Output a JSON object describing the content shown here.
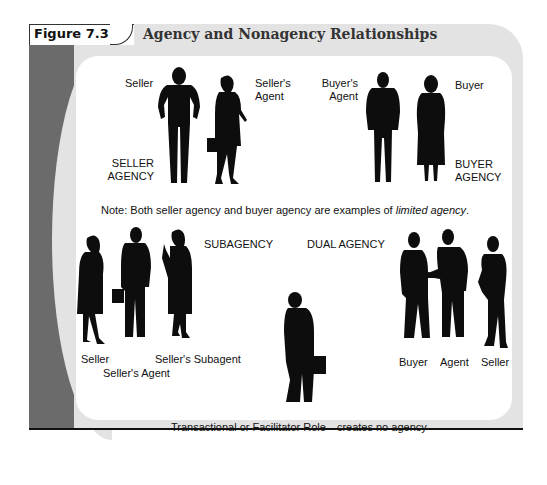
{
  "figure": {
    "number": "Figure 7.3",
    "title": "Agency and Nonagency Relationships"
  },
  "seller_agency": {
    "group_label_line1": "SELLER",
    "group_label_line2": "AGENCY",
    "figures": [
      {
        "role": "Seller"
      },
      {
        "role_line1": "Seller's",
        "role_line2": "Agent"
      }
    ]
  },
  "buyer_agency": {
    "group_label_line1": "BUYER",
    "group_label_line2": "AGENCY",
    "figures": [
      {
        "role_line1": "Buyer's",
        "role_line2": "Agent"
      },
      {
        "role": "Buyer"
      }
    ]
  },
  "note": {
    "prefix": "Note: Both seller agency and buyer agency are examples of ",
    "emphasis": "limited agency",
    "suffix": "."
  },
  "subagency": {
    "group_label": "SUBAGENCY",
    "roles": [
      "Seller",
      "Seller's Agent",
      "Seller's Subagent"
    ]
  },
  "dual_agency": {
    "group_label": "DUAL AGENCY",
    "roles": [
      "Buyer",
      "Agent",
      "Seller"
    ]
  },
  "facilitator": {
    "caption": "Transactional or Facilitator Role—creates no agency"
  },
  "colors": {
    "silhouette": "#0d0d0d",
    "frame_gray": "#e3e3e3",
    "band_dark": "#6b6b6b",
    "panel": "#ffffff"
  }
}
